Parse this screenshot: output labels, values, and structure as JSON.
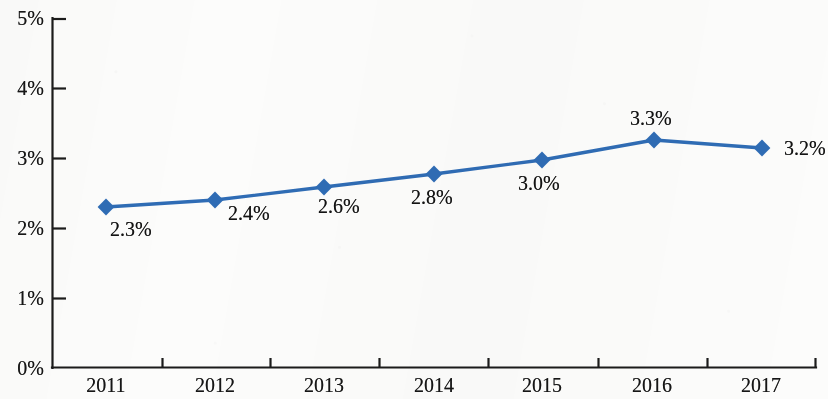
{
  "chart_data": {
    "type": "line",
    "title": "",
    "subtitle": "",
    "xlabel": "",
    "ylabel": "",
    "categories": [
      "2011",
      "2012",
      "2013",
      "2014",
      "2015",
      "2016",
      "2017"
    ],
    "series": [
      {
        "name": "",
        "values": [
          2.3,
          2.4,
          2.6,
          2.8,
          3.0,
          3.3,
          3.2
        ],
        "point_labels": [
          "2.3%",
          "2.4%",
          "2.6%",
          "2.8%",
          "3.0%",
          "3.3%",
          "3.2%"
        ],
        "color": "#2f6cb5",
        "marker": "diamond"
      }
    ],
    "ylim": [
      0,
      5
    ],
    "ytick_values": [
      0,
      1,
      2,
      3,
      4,
      5
    ],
    "ytick_labels": [
      "0%",
      "1%",
      "2%",
      "3%",
      "4%",
      "5%"
    ],
    "grid": false,
    "legend": false,
    "legend_position": "none",
    "units": "percent"
  },
  "axes": {
    "y_labels": [
      "5%",
      "4%",
      "3%",
      "2%",
      "1%",
      "0%"
    ],
    "x_labels": [
      "2011",
      "2012",
      "2013",
      "2014",
      "2015",
      "2016",
      "2017"
    ],
    "axis_color": "#1a1a1a"
  },
  "labels": {
    "p0": "2.3%",
    "p1": "2.4%",
    "p2": "2.6%",
    "p3": "2.8%",
    "p4": "3.0%",
    "p5": "3.3%",
    "p6": "3.2%"
  },
  "geometry": {
    "plot_left": 52,
    "plot_right": 816,
    "plot_top": 18,
    "plot_bottom": 368,
    "point_x": [
      106,
      215,
      324,
      434,
      542,
      654,
      762
    ],
    "point_y": [
      207,
      200,
      187,
      174,
      160,
      140,
      148
    ],
    "x_tick_x": [
      52,
      162,
      270,
      379,
      488,
      598,
      707,
      816
    ],
    "y_tick_y": [
      18,
      88,
      158,
      228,
      298,
      368
    ]
  }
}
